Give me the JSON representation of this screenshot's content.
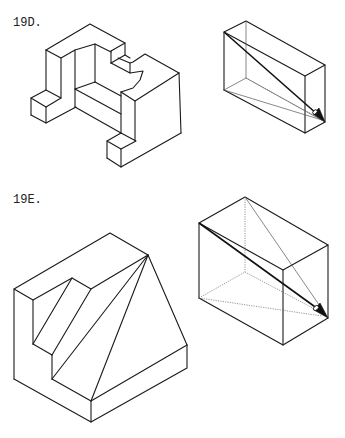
{
  "top_remnant": ".",
  "figures": [
    {
      "id": "19D",
      "label": "19D.",
      "object": "stepped isometric block with notch and two corner blocks",
      "view_box": "rectangular box with viewing-direction arrow"
    },
    {
      "id": "19E",
      "label": "19E.",
      "object": "isometric block with stepped cut and sloped faces",
      "view_box": "rectangular box with viewing-direction arrow"
    }
  ],
  "colors": {
    "line": "#1a1a1a",
    "hidden": "#666666",
    "background": "#ffffff"
  }
}
